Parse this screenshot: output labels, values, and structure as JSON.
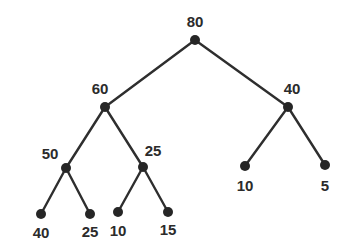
{
  "diagram": {
    "type": "binary-tree",
    "background_color": "#ffffff",
    "node_color": "#262626",
    "edge_color": "#2e2e2e",
    "label_color": "#2b2b2b",
    "node_radius": 5,
    "edge_width": 2.4,
    "nodes": [
      {
        "id": "n80",
        "label": "80",
        "x": 195,
        "y": 40,
        "label_x": 195,
        "label_y": 21,
        "font_size": 15,
        "level": 0,
        "kind": "root"
      },
      {
        "id": "n60",
        "label": "60",
        "x": 105,
        "y": 107,
        "label_x": 100,
        "label_y": 88,
        "font_size": 15,
        "level": 1,
        "kind": "internal"
      },
      {
        "id": "n40r",
        "label": "40",
        "x": 288,
        "y": 107,
        "label_x": 292,
        "label_y": 88,
        "font_size": 15,
        "level": 1,
        "kind": "internal"
      },
      {
        "id": "n50",
        "label": "50",
        "x": 66,
        "y": 168,
        "label_x": 50,
        "label_y": 153,
        "font_size": 15,
        "level": 2,
        "kind": "internal"
      },
      {
        "id": "n25",
        "label": "25",
        "x": 143,
        "y": 167,
        "label_x": 153,
        "label_y": 150,
        "font_size": 15,
        "level": 2,
        "kind": "internal"
      },
      {
        "id": "n10r",
        "label": "10",
        "x": 245,
        "y": 166,
        "label_x": 245,
        "label_y": 185,
        "font_size": 15,
        "level": 2,
        "kind": "leaf"
      },
      {
        "id": "n5",
        "label": "5",
        "x": 325,
        "y": 165,
        "label_x": 325,
        "label_y": 185,
        "font_size": 15,
        "level": 2,
        "kind": "leaf"
      },
      {
        "id": "n40l",
        "label": "40",
        "x": 41,
        "y": 214,
        "label_x": 41,
        "label_y": 232,
        "font_size": 15,
        "level": 3,
        "kind": "leaf"
      },
      {
        "id": "n25l",
        "label": "25",
        "x": 90,
        "y": 214,
        "label_x": 90,
        "label_y": 231,
        "font_size": 15,
        "level": 3,
        "kind": "leaf"
      },
      {
        "id": "n10l",
        "label": "10",
        "x": 118,
        "y": 212,
        "label_x": 118,
        "label_y": 230,
        "font_size": 15,
        "level": 3,
        "kind": "leaf"
      },
      {
        "id": "n15",
        "label": "15",
        "x": 168,
        "y": 212,
        "label_x": 168,
        "label_y": 229,
        "font_size": 15,
        "level": 3,
        "kind": "leaf"
      }
    ],
    "edges": [
      {
        "from": "n80",
        "to": "n60",
        "x1": 195,
        "y1": 40,
        "x2": 105,
        "y2": 107
      },
      {
        "from": "n80",
        "to": "n40r",
        "x1": 195,
        "y1": 40,
        "x2": 288,
        "y2": 107
      },
      {
        "from": "n60",
        "to": "n50",
        "x1": 105,
        "y1": 107,
        "x2": 66,
        "y2": 168
      },
      {
        "from": "n60",
        "to": "n25",
        "x1": 105,
        "y1": 107,
        "x2": 143,
        "y2": 167
      },
      {
        "from": "n40r",
        "to": "n10r",
        "x1": 288,
        "y1": 107,
        "x2": 245,
        "y2": 166
      },
      {
        "from": "n40r",
        "to": "n5",
        "x1": 288,
        "y1": 107,
        "x2": 325,
        "y2": 165
      },
      {
        "from": "n50",
        "to": "n40l",
        "x1": 66,
        "y1": 168,
        "x2": 41,
        "y2": 214
      },
      {
        "from": "n50",
        "to": "n25l",
        "x1": 66,
        "y1": 168,
        "x2": 90,
        "y2": 214
      },
      {
        "from": "n25",
        "to": "n10l",
        "x1": 143,
        "y1": 167,
        "x2": 118,
        "y2": 212
      },
      {
        "from": "n25",
        "to": "n15",
        "x1": 143,
        "y1": 167,
        "x2": 168,
        "y2": 212
      }
    ]
  }
}
